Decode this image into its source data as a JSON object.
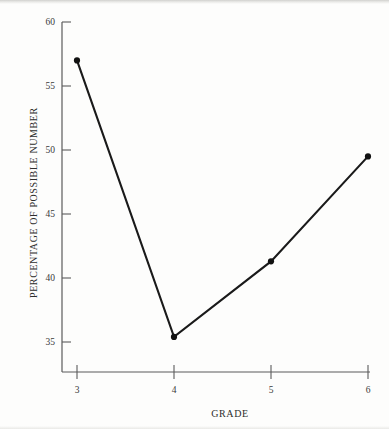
{
  "chart_data": {
    "type": "line",
    "title": "",
    "xlabel": "GRADE",
    "ylabel": "PERCENTAGE OF POSSIBLE NUMBER",
    "x": [
      3,
      4,
      5,
      6
    ],
    "values": [
      57.0,
      35.4,
      41.3,
      49.5
    ],
    "categories": [
      "3",
      "4",
      "5",
      "6"
    ],
    "xlim": [
      3,
      6
    ],
    "ylim": [
      32.5,
      60
    ],
    "xticks": [
      "3",
      "4",
      "5",
      "6"
    ],
    "yticks": [
      "60",
      "55",
      "50",
      "45",
      "40",
      "35"
    ],
    "grid": false,
    "legend": "none",
    "series": [
      {
        "name": "percentage-of-possible-number",
        "values": [
          57.0,
          35.4,
          41.3,
          49.5
        ]
      }
    ],
    "line_color": "#1a1a1a",
    "marker": "circle",
    "marker_color": "#111111"
  },
  "axes": {
    "y_axis_name": "percentage-of-possible-number-axis",
    "x_axis_name": "grade-axis"
  }
}
